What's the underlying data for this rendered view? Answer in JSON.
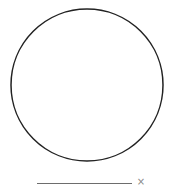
{
  "drawing": {
    "shape": "circle",
    "cx": 87,
    "cy": 85,
    "r": 76,
    "stroke": "#222222",
    "fill": "#ffffff"
  },
  "input": {
    "value": "",
    "clear_icon": "×"
  }
}
